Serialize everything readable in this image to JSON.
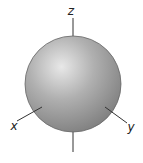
{
  "diagram": {
    "type": "s-orbital",
    "axes": {
      "z": "z",
      "x": "x",
      "y": "y"
    },
    "colors": {
      "sphere_highlight": "#e6e6e6",
      "sphere_mid": "#a8a8a8",
      "sphere_edge": "#7a7a7a",
      "outline": "#555555",
      "axis": "#333333"
    }
  }
}
